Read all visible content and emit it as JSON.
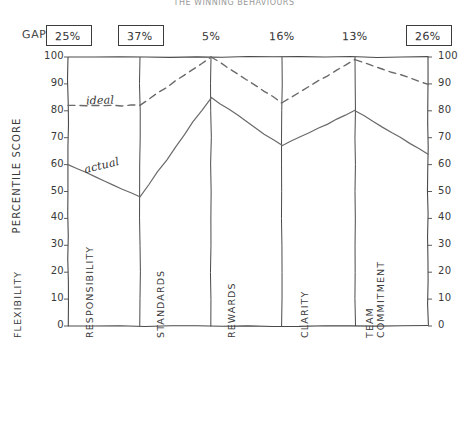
{
  "title": "THE WINNING BEHAVIOURS",
  "gap": {
    "label": "GAP",
    "values": [
      "25%",
      "37%",
      "5%",
      "16%",
      "13%",
      "26%"
    ],
    "boxed": [
      true,
      true,
      false,
      false,
      false,
      true
    ]
  },
  "axes": {
    "y_title": "PERCENTILE SCORE",
    "y_ticks": [
      "100",
      "90",
      "80",
      "70",
      "60",
      "50",
      "40",
      "30",
      "20",
      "10",
      "0"
    ],
    "y_ticks_right": [
      "100",
      "90",
      "80",
      "70",
      "60",
      "50",
      "40",
      "30",
      "20",
      "10",
      "0"
    ],
    "x_categories": [
      "FLEXIBILITY",
      "RESPONSIBILITY",
      "STANDARDS",
      "REWARDS",
      "CLARITY",
      "TEAM COMMITMENT"
    ]
  },
  "legend": {
    "ideal": "ideal",
    "actual": "actual"
  },
  "colors": {
    "line": "#6a6a6a",
    "axis": "#4a4a4a",
    "text": "#3a3a3a",
    "title": "#9a9a9a"
  },
  "chart_data": {
    "type": "line",
    "title": "THE WINNING BEHAVIOURS",
    "xlabel": "",
    "ylabel": "PERCENTILE SCORE",
    "ylim": [
      0,
      100
    ],
    "yticks": [
      0,
      10,
      20,
      30,
      40,
      50,
      60,
      70,
      80,
      90,
      100
    ],
    "grid": "vertical-category-lines",
    "legend": "inline-annotations",
    "categories": [
      "FLEXIBILITY",
      "RESPONSIBILITY",
      "STANDARDS",
      "REWARDS",
      "CLARITY",
      "TEAM COMMITMENT"
    ],
    "series": [
      {
        "name": "ideal",
        "style": "dashed",
        "values": [
          82,
          82,
          100,
          83,
          99,
          90
        ]
      },
      {
        "name": "actual",
        "style": "solid",
        "values": [
          60,
          48,
          85,
          67,
          80,
          64
        ]
      }
    ],
    "annotations": [
      {
        "text": "25%",
        "category": "FLEXIBILITY",
        "kind": "gap",
        "highlighted": true
      },
      {
        "text": "37%",
        "category": "RESPONSIBILITY",
        "kind": "gap",
        "highlighted": true
      },
      {
        "text": "5%",
        "category": "STANDARDS",
        "kind": "gap",
        "highlighted": false
      },
      {
        "text": "16%",
        "category": "REWARDS",
        "kind": "gap",
        "highlighted": false
      },
      {
        "text": "13%",
        "category": "CLARITY",
        "kind": "gap",
        "highlighted": false
      },
      {
        "text": "26%",
        "category": "TEAM COMMITMENT",
        "kind": "gap",
        "highlighted": true
      }
    ]
  },
  "geometry": {
    "x_positions": [
      68,
      140,
      211,
      282,
      355,
      428
    ],
    "y_top": 57,
    "y_bottom": 326
  }
}
